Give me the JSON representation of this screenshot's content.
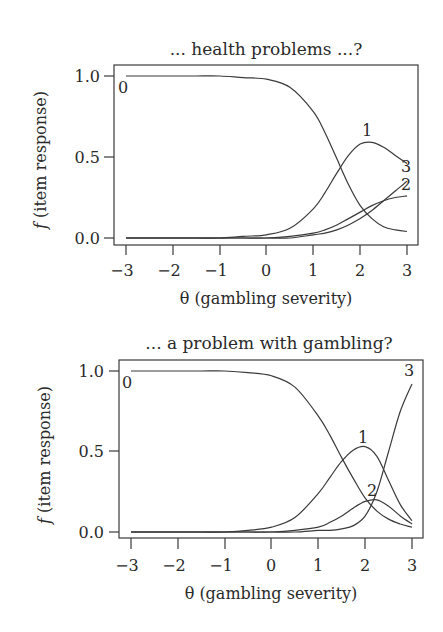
{
  "chart_data": [
    {
      "type": "line",
      "title": "... health problems ...?",
      "xlabel": "θ (gambling severity)",
      "ylabel": "f (item response)",
      "xlim": [
        -3,
        3
      ],
      "ylim": [
        0,
        1
      ],
      "x_ticks": [
        "−3",
        "−2",
        "−1",
        "0",
        "1",
        "2",
        "3"
      ],
      "y_ticks": [
        "0.0",
        "0.5",
        "1.0"
      ],
      "grid": false,
      "x": [
        -3,
        -2.5,
        -2,
        -1.5,
        -1,
        -0.5,
        0,
        0.5,
        1,
        1.25,
        1.5,
        1.75,
        2,
        2.25,
        2.5,
        2.75,
        3
      ],
      "series": [
        {
          "name": "0",
          "values": [
            1.0,
            1.0,
            1.0,
            1.0,
            1.0,
            0.99,
            0.98,
            0.93,
            0.78,
            0.65,
            0.49,
            0.33,
            0.2,
            0.12,
            0.07,
            0.05,
            0.04
          ]
        },
        {
          "name": "1",
          "values": [
            0.0,
            0.0,
            0.0,
            0.0,
            0.0,
            0.01,
            0.02,
            0.06,
            0.18,
            0.28,
            0.4,
            0.51,
            0.58,
            0.59,
            0.56,
            0.51,
            0.46
          ]
        },
        {
          "name": "2",
          "values": [
            0.0,
            0.0,
            0.0,
            0.0,
            0.0,
            0.0,
            0.0,
            0.01,
            0.03,
            0.05,
            0.08,
            0.12,
            0.16,
            0.2,
            0.23,
            0.25,
            0.26
          ]
        },
        {
          "name": "3",
          "values": [
            0.0,
            0.0,
            0.0,
            0.0,
            0.0,
            0.0,
            0.0,
            0.0,
            0.02,
            0.03,
            0.05,
            0.08,
            0.12,
            0.17,
            0.23,
            0.29,
            0.35
          ]
        }
      ]
    },
    {
      "type": "line",
      "title": "... a problem with gambling?",
      "xlabel": "θ (gambling severity)",
      "ylabel": "f (item response)",
      "xlim": [
        -3,
        3
      ],
      "ylim": [
        0,
        1
      ],
      "x_ticks": [
        "−3",
        "−2",
        "−1",
        "0",
        "1",
        "2",
        "3"
      ],
      "y_ticks": [
        "0.0",
        "0.5",
        "1.0"
      ],
      "grid": false,
      "x": [
        -3,
        -2.5,
        -2,
        -1.5,
        -1,
        -0.5,
        0,
        0.5,
        1,
        1.25,
        1.5,
        1.75,
        2,
        2.25,
        2.5,
        2.75,
        3
      ],
      "series": [
        {
          "name": "0",
          "values": [
            1.0,
            1.0,
            1.0,
            1.0,
            1.0,
            0.99,
            0.97,
            0.9,
            0.72,
            0.6,
            0.46,
            0.33,
            0.21,
            0.13,
            0.08,
            0.05,
            0.03
          ]
        },
        {
          "name": "1",
          "values": [
            0.0,
            0.0,
            0.0,
            0.0,
            0.0,
            0.01,
            0.03,
            0.09,
            0.24,
            0.34,
            0.44,
            0.51,
            0.53,
            0.47,
            0.32,
            0.17,
            0.07
          ]
        },
        {
          "name": "2",
          "values": [
            0.0,
            0.0,
            0.0,
            0.0,
            0.0,
            0.0,
            0.0,
            0.01,
            0.03,
            0.06,
            0.1,
            0.15,
            0.19,
            0.2,
            0.16,
            0.1,
            0.05
          ]
        },
        {
          "name": "3",
          "values": [
            0.0,
            0.0,
            0.0,
            0.0,
            0.0,
            0.0,
            0.0,
            0.0,
            0.01,
            0.01,
            0.02,
            0.04,
            0.1,
            0.25,
            0.5,
            0.75,
            0.92
          ]
        }
      ]
    }
  ],
  "labels": {
    "top": {
      "title": "... health problems ...?",
      "xlabel": "θ (gambling severity)",
      "ylabel_f": "f",
      "ylabel_rest": " (item response)"
    },
    "bottom": {
      "title": "... a problem with gambling?",
      "xlabel": "θ (gambling severity)",
      "ylabel_f": "f",
      "ylabel_rest": " (item response)"
    },
    "x_ticks": [
      "−3",
      "−2",
      "−1",
      "0",
      "1",
      "2",
      "3"
    ],
    "y_ticks": [
      "0.0",
      "0.5",
      "1.0"
    ],
    "curve_names": [
      "0",
      "1",
      "2",
      "3"
    ]
  },
  "colors": {
    "line": "#3a3a3a",
    "text": "#2a2a2a",
    "background": "#ffffff"
  }
}
